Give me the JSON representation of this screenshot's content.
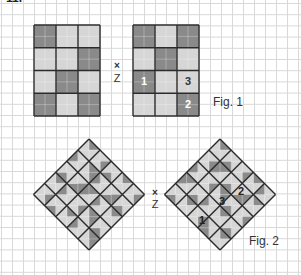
{
  "page": {
    "corner_glyph": "11."
  },
  "colors": {
    "grid_line": "#d9d9d9",
    "outline": "#2b2b2b",
    "dark": "#8a8a8a",
    "light": "#d6d6d6",
    "number_on_dark": "#ffffff",
    "number_on_light": "#333333"
  },
  "fig1": {
    "caption": "Fig. 1",
    "center_mark": "×",
    "center_label": "Z",
    "left_grid": {
      "x": 34,
      "y": 25,
      "cell_w": 22,
      "cell_h": 22.75,
      "cells": [
        [
          "D",
          "L",
          "L"
        ],
        [
          "L",
          "L",
          "D"
        ],
        [
          "L",
          "D",
          "L"
        ],
        [
          "D",
          "L",
          "D"
        ]
      ]
    },
    "right_grid": {
      "x": 133,
      "y": 25,
      "cell_w": 22,
      "cell_h": 22.75,
      "cells": [
        [
          "D",
          "L",
          "D"
        ],
        [
          "L",
          "D",
          "L"
        ],
        [
          "D",
          "L",
          "L"
        ],
        [
          "L",
          "L",
          "D"
        ]
      ],
      "numbers": [
        {
          "row": 2,
          "col": 0,
          "text": "1"
        },
        {
          "row": 2,
          "col": 2,
          "text": "3"
        },
        {
          "row": 3,
          "col": 2,
          "text": "2"
        }
      ]
    }
  },
  "fig2": {
    "caption": "Fig. 2",
    "center_mark": "×",
    "center_label": "Z",
    "half": 11.1,
    "left_diamond": {
      "top_x": 89,
      "top_y": 139,
      "cells": [
        [
          "DLLL",
          "LDLL",
          "LLDL",
          "DLLL",
          "LDLL"
        ],
        [
          "LLLD",
          "DDLL",
          "LLLD",
          "LDDL",
          "LLDL"
        ],
        [
          "LLDL",
          "LDDL",
          "DLLD",
          "LLLD",
          "DLLL"
        ],
        [
          "DLLL",
          "LLLD",
          "LDLL",
          "DDLL",
          "LLDL"
        ],
        [
          "LDLL",
          "LLDL",
          "DLLL",
          "LLLD",
          "DDLL"
        ]
      ]
    },
    "right_diamond": {
      "top_x": 220,
      "top_y": 139,
      "cells": [
        [
          "DLLL",
          "LLDL",
          "LDLL",
          "DLLL",
          "LLLD"
        ],
        [
          "LDLL",
          "DLLD",
          "LLDL",
          "LDDL",
          "DLLL"
        ],
        [
          "LLLD",
          "LDLL",
          "DDLL",
          "LLDL",
          "LDLL"
        ],
        [
          "DLLD",
          "LLDL",
          "LLLD",
          "DLLL",
          "LLDL"
        ],
        [
          "LLDL",
          "DLLL",
          "LDLL",
          "LLDD",
          "DLLL"
        ]
      ],
      "numbers": [
        {
          "x": 238,
          "y": 186,
          "text": "2"
        },
        {
          "x": 219,
          "y": 196,
          "text": "3"
        },
        {
          "x": 199,
          "y": 215,
          "text": "1"
        }
      ]
    }
  }
}
